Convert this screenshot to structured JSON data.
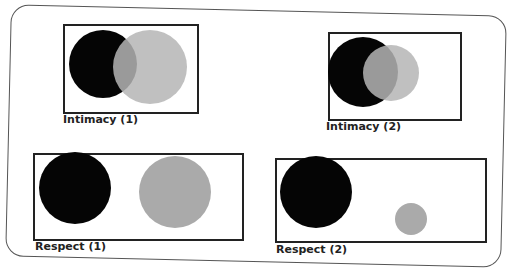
{
  "panels": [
    {
      "label": "Intimacy (1)",
      "box": [
        63,
        24,
        132,
        86
      ],
      "label_pos": [
        63,
        113
      ],
      "circles": [
        {
          "cx": 103,
          "cy": 64,
          "r": 34,
          "color": "#050505",
          "opacity": 1
        },
        {
          "cx": 150,
          "cy": 67,
          "r": 37,
          "color": "#b5b5b5",
          "opacity": 0.85
        }
      ]
    },
    {
      "label": "Intimacy (2)",
      "box": [
        328,
        32,
        130,
        85
      ],
      "label_pos": [
        326,
        120
      ],
      "circles": [
        {
          "cx": 363,
          "cy": 72,
          "r": 35,
          "color": "#050505",
          "opacity": 1
        },
        {
          "cx": 391,
          "cy": 73,
          "r": 28,
          "color": "#b5b5b5",
          "opacity": 0.85
        }
      ]
    },
    {
      "label": "Respect (1)",
      "box": [
        33,
        153,
        207,
        84
      ],
      "label_pos": [
        35,
        240
      ],
      "circles": [
        {
          "cx": 75,
          "cy": 188,
          "r": 36,
          "color": "#050505",
          "opacity": 1
        },
        {
          "cx": 175,
          "cy": 192,
          "r": 36,
          "color": "#aaaaaa",
          "opacity": 1
        }
      ]
    },
    {
      "label": "Respect (2)",
      "box": [
        275,
        158,
        208,
        81
      ],
      "label_pos": [
        276,
        243
      ],
      "circles": [
        {
          "cx": 316,
          "cy": 192,
          "r": 36,
          "color": "#050505",
          "opacity": 1
        },
        {
          "cx": 411,
          "cy": 219,
          "r": 16,
          "color": "#aaaaaa",
          "opacity": 1
        }
      ]
    }
  ]
}
